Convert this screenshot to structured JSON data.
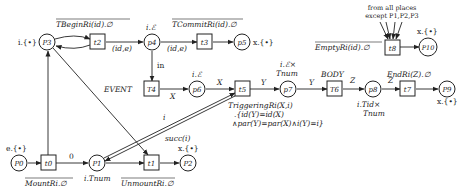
{
  "diagram": {
    "type": "petri-net",
    "places": [
      {
        "id": "p0",
        "label": "P0",
        "annotation": "e.{•}"
      },
      {
        "id": "p1",
        "label": "P1",
        "annotation": "i.Tnum"
      },
      {
        "id": "p2",
        "label": "P2",
        "annotation": "x.{•}"
      },
      {
        "id": "p3",
        "label": "P3",
        "annotation": "i.{•}"
      },
      {
        "id": "p4",
        "label": "p4",
        "annotation": "i.ℰ"
      },
      {
        "id": "p5",
        "label": "p5",
        "annotation": "x.{•}"
      },
      {
        "id": "p6",
        "label": "p6",
        "annotation": "i.ℰ"
      },
      {
        "id": "p7",
        "label": "p7",
        "annotation_line1": "i.ℰ×",
        "annotation_line2": "Tnum"
      },
      {
        "id": "p8",
        "label": "p8",
        "annotation_line1": "i.Tid×",
        "annotation_line2": "Tnum"
      },
      {
        "id": "p9",
        "label": "P9",
        "annotation": "x.{•}"
      },
      {
        "id": "p10",
        "label": "P10",
        "annotation": "x.{•}"
      }
    ],
    "transitions": [
      {
        "id": "t0",
        "label": "t0",
        "annotation": "MountRi.∅"
      },
      {
        "id": "t1",
        "label": "t1",
        "annotation": "UnmountRi.∅"
      },
      {
        "id": "t2",
        "label": "t2",
        "annotation": "TBeginRi(id).∅"
      },
      {
        "id": "t3",
        "label": "t3",
        "annotation": "TCommitRi(id).∅"
      },
      {
        "id": "T4",
        "label": "T4",
        "annotation": "EVENT"
      },
      {
        "id": "t5",
        "label": "t5",
        "annotation_line1": "TriggeringRi(X,i)",
        "annotation_line2": ".{id(Y)=id(X)",
        "annotation_line3": "∧par(Y)=par(X)∧i(Y)=i}"
      },
      {
        "id": "T6",
        "label": "T6",
        "annotation": "BODY"
      },
      {
        "id": "t7",
        "label": "t7",
        "annotation": "EndRi(Z).∅"
      },
      {
        "id": "t8",
        "label": "t8",
        "annotation": "EmptyRi(id).∅",
        "note_line1": "from all places",
        "note_line2": "except P1,P2,P3"
      }
    ],
    "arc_labels": {
      "t0_p1": "0",
      "t2_p4": "(id,e)",
      "p4_t3": "(id,e)",
      "p4_T4": "in",
      "T4_p6": "X",
      "p6_t5": "X",
      "p1_t5": "i",
      "t5_p1": "succ(i)",
      "t5_p7": "Y",
      "p7_T6": "Y",
      "T6_p8": "Z",
      "p8_t7": "Z"
    }
  }
}
